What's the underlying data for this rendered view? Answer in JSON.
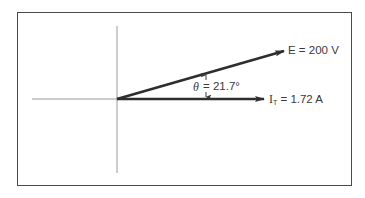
{
  "diagram": {
    "type": "phasor-diagram",
    "frame": {
      "left": 17,
      "top": 12,
      "right": 352,
      "bottom": 186,
      "border_color": "#4a4a4a"
    },
    "origin": {
      "x": 117,
      "y": 99
    },
    "axes": {
      "horizontal": {
        "x1": 32,
        "x2": 117,
        "y": 99,
        "color": "#9a9a9a"
      },
      "vertical": {
        "x": 117,
        "y1": 26,
        "y2": 173,
        "color": "#9a9a9a"
      }
    },
    "vectors": [
      {
        "id": "E",
        "symbol": "E",
        "label": "E = 200 V",
        "value": "200 V",
        "tip": {
          "x": 284,
          "y": 51
        },
        "color": "#2e2e2e"
      },
      {
        "id": "IT",
        "symbol": "I",
        "subscript": "T",
        "equals_value": " = 1.72 A",
        "value": "1.72 A",
        "tip": {
          "x": 264,
          "y": 99
        },
        "color": "#2e2e2e"
      }
    ],
    "angle": {
      "symbol": "θ",
      "value_text": "= 21.7°",
      "degrees": 21.7,
      "marker_x": 206
    }
  }
}
